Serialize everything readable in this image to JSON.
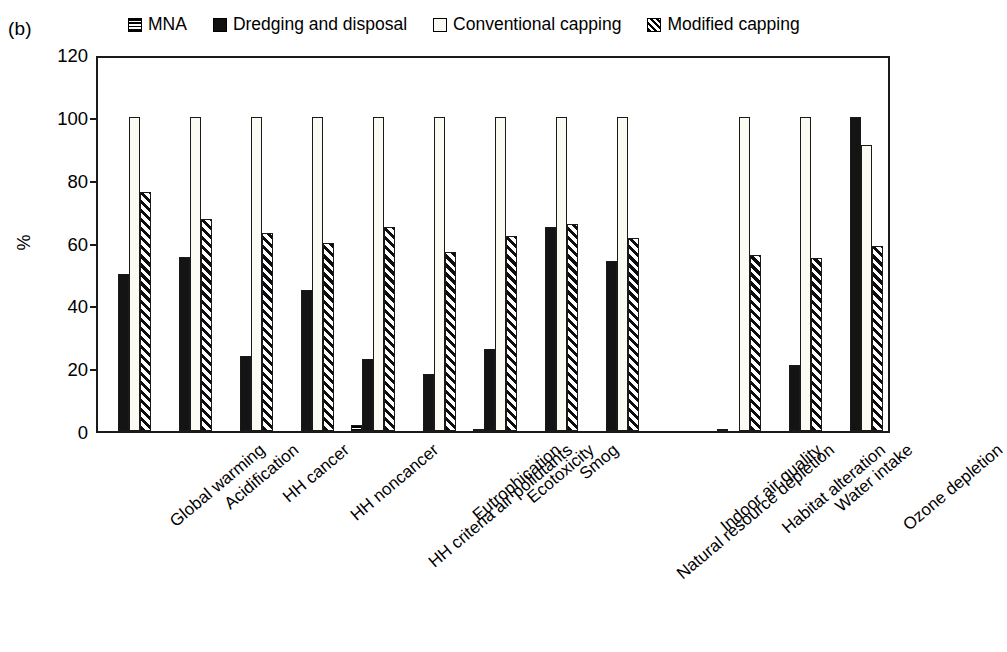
{
  "panel": {
    "label": "(b)"
  },
  "legend": {
    "items": [
      {
        "label": "MNA",
        "icon": "horizontal-hatch-swatch",
        "color": "#000000"
      },
      {
        "label": "Dredging and disposal",
        "icon": "solid-black-swatch",
        "color": "#111111"
      },
      {
        "label": "Conventional capping",
        "icon": "white-swatch",
        "color": "#fbfbf6"
      },
      {
        "label": "Modified capping",
        "icon": "diagonal-hatch-swatch",
        "color": "#000000"
      }
    ]
  },
  "chart_data": {
    "type": "bar",
    "title": "",
    "xlabel": "",
    "ylabel": "%",
    "ylim": [
      0,
      120
    ],
    "yticks": [
      0,
      20,
      40,
      60,
      80,
      100,
      120
    ],
    "grid": false,
    "legend_position": "top",
    "categories": [
      "Global warming",
      "Acidification",
      "HH cancer",
      "HH noncancer",
      "HH criteria air pollutants",
      "Eutrophication",
      "Ecotoxicity",
      "Smog",
      "Natural resource depletion",
      "Indoor air quality",
      "Habitat alteration",
      "Water intake",
      "Ozone depletion"
    ],
    "series": [
      {
        "name": "MNA",
        "values": [
          0,
          0,
          0,
          0,
          2,
          0,
          0.5,
          0,
          0,
          0,
          0.5,
          0,
          0
        ]
      },
      {
        "name": "Dredging and disposal",
        "values": [
          50,
          55.5,
          24,
          45,
          23,
          18,
          26,
          65,
          54,
          0,
          0,
          21,
          100
        ]
      },
      {
        "name": "Conventional capping",
        "values": [
          100,
          100,
          100,
          100,
          100,
          100,
          100,
          100,
          100,
          0,
          100,
          100,
          91
        ]
      },
      {
        "name": "Modified capping",
        "values": [
          76,
          67.5,
          63,
          60,
          65,
          57,
          62,
          66,
          61.5,
          0,
          56,
          55,
          59
        ]
      }
    ]
  }
}
